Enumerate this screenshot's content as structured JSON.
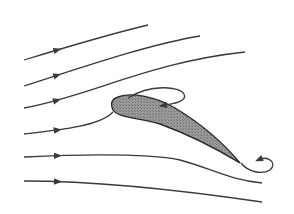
{
  "diagram": {
    "title": "",
    "colors": {
      "background": "#ffffff",
      "line": "#3a3a3a",
      "airfoil_fill": "#8a8a8a"
    },
    "streamlines": [
      {
        "id": "streamline-1",
        "path": "M24,60 C70,46 110,34 148,25",
        "arrow": [
          58,
          50
        ]
      },
      {
        "id": "streamline-2",
        "path": "M24,86 C80,68 150,44 200,36",
        "arrow": [
          58,
          77
        ]
      },
      {
        "id": "streamline-3",
        "path": "M24,108 C90,96 150,62 245,52",
        "arrow": [
          58,
          104
        ]
      },
      {
        "id": "streamline-4",
        "path": "M24,134 C60,130 100,126 113,112",
        "arrow": [
          58,
          132
        ]
      },
      {
        "id": "streamline-5",
        "path": "M24,157 C90,154 150,154 180,160 C210,168 230,180 262,183",
        "arrow": [
          58,
          157
        ]
      },
      {
        "id": "streamline-6",
        "path": "M24,181 C100,181 180,190 262,202",
        "arrow": [
          58,
          181
        ]
      }
    ],
    "airfoil": {
      "path": "M118,97 C130,92 155,96 175,108 C205,126 225,145 240,163 C222,152 190,135 160,124 C140,118 118,118 113,110 C110,103 112,99 118,97 Z"
    },
    "separation_vortices": [
      {
        "id": "upper-vortex",
        "path": "M128,98 C150,84 180,86 184,94 C188,102 172,104 160,106",
        "arrow": [
          163,
          105
        ]
      },
      {
        "id": "trailing-edge-vortex",
        "path": "M241,163 C248,172 262,175 270,170 C278,163 268,155 258,160",
        "arrow": [
          258,
          160
        ]
      }
    ]
  }
}
